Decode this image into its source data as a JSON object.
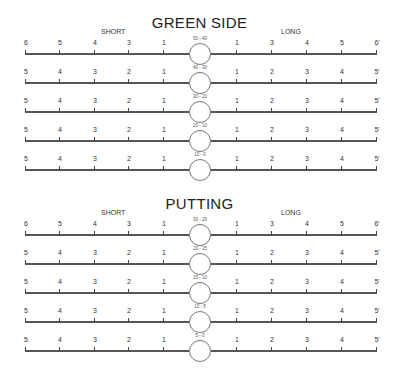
{
  "sections": [
    {
      "title": "GREEN SIDE",
      "short_label": "SHORT",
      "long_label": "LONG",
      "rows": [
        {
          "range": "50 - 40",
          "left": [
            "6",
            "5",
            "4",
            "3",
            "1"
          ],
          "right": [
            "1",
            "3",
            "4",
            "5",
            "6'"
          ]
        },
        {
          "range": "40 - 30",
          "left": [
            "5",
            "4",
            "3",
            "2",
            "1"
          ],
          "right": [
            "1",
            "2",
            "3",
            "4",
            "5'"
          ]
        },
        {
          "range": "30 - 20",
          "left": [
            "5",
            "4",
            "3",
            "2",
            "1"
          ],
          "right": [
            "1",
            "2",
            "3",
            "4",
            "5'"
          ]
        },
        {
          "range": "20 - 10",
          "left": [
            "5",
            "4",
            "3",
            "2",
            "1"
          ],
          "right": [
            "1",
            "2",
            "3",
            "4",
            "5'"
          ]
        },
        {
          "range": "10 - 0",
          "left": [
            "5",
            "4",
            "3",
            "2",
            "1"
          ],
          "right": [
            "1",
            "2",
            "3",
            "4",
            "5'"
          ]
        }
      ]
    },
    {
      "title": "PUTTING",
      "short_label": "SHORT",
      "long_label": "LONG",
      "rows": [
        {
          "range": "30 - 20",
          "left": [
            "6",
            "5",
            "4",
            "3",
            "1"
          ],
          "right": [
            "1",
            "3",
            "4",
            "5",
            "6'"
          ]
        },
        {
          "range": "20 - 15",
          "left": [
            "5",
            "4",
            "3",
            "2",
            "1"
          ],
          "right": [
            "1",
            "2",
            "3",
            "4",
            "5'"
          ]
        },
        {
          "range": "15 - 10",
          "left": [
            "5",
            "4",
            "3",
            "2",
            "1"
          ],
          "right": [
            "1",
            "2",
            "3",
            "4",
            "5'"
          ]
        },
        {
          "range": "10 - 5",
          "left": [
            "5",
            "4",
            "3",
            "2",
            "1"
          ],
          "right": [
            "1",
            "2",
            "3",
            "4",
            "5'"
          ]
        },
        {
          "range": "5 - 0",
          "left": [
            "5",
            "4",
            "3",
            "2",
            "1"
          ],
          "right": [
            "1",
            "2",
            "3",
            "4",
            "5'"
          ]
        }
      ]
    }
  ]
}
